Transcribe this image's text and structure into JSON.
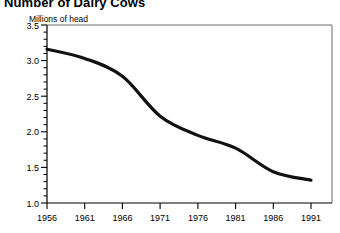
{
  "title": "Number of Dairy Cows",
  "axis_note": "Millions of head",
  "ticks": {
    "y": [
      "3.5",
      "3.0",
      "2.5",
      "2.0",
      "1.5",
      "1.0"
    ],
    "x": [
      "1956",
      "1961",
      "1966",
      "1971",
      "1976",
      "1981",
      "1986",
      "1991"
    ]
  },
  "colors": {
    "line": "#111111",
    "axis": "#000000",
    "frame": "#6e6e6e",
    "background": "#ffffff"
  },
  "chart_data": {
    "type": "line",
    "title": "Number of Dairy Cows",
    "xlabel": "",
    "ylabel": "Millions of head",
    "ylim": [
      1.0,
      3.5
    ],
    "xlim": [
      1956,
      1991
    ],
    "grid": false,
    "legend": "none",
    "x": [
      1956,
      1961,
      1966,
      1971,
      1976,
      1981,
      1986,
      1991
    ],
    "values": [
      3.16,
      3.03,
      2.78,
      2.22,
      1.95,
      1.77,
      1.44,
      1.32
    ],
    "series": [
      {
        "name": "Number of Dairy Cows",
        "values": [
          3.16,
          3.03,
          2.78,
          2.22,
          1.95,
          1.77,
          1.44,
          1.32
        ]
      }
    ],
    "x_tick_labels": [
      "1956",
      "1961",
      "1966",
      "1971",
      "1976",
      "1981",
      "1986",
      "1991"
    ],
    "y_tick_labels": [
      "1.0",
      "1.5",
      "2.0",
      "2.5",
      "3.0",
      "3.5"
    ],
    "y_tick_values": [
      1.0,
      1.5,
      2.0,
      2.5,
      3.0,
      3.5
    ],
    "minor_tick_interval": 0.1
  }
}
